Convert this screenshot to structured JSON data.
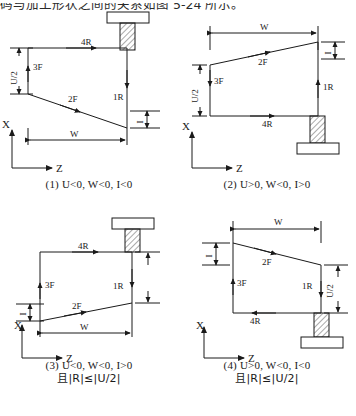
{
  "header": {
    "cropped_line": "码与加工形状之间的关系如图 5-24 所示。"
  },
  "figure": {
    "labels": {
      "axis_x": "X",
      "axis_z": "Z",
      "dim_w": "W",
      "dim_u_half": "U/2",
      "dim_i": "I",
      "seg_1r": "1R",
      "seg_2f": "2F",
      "seg_3f": "3F",
      "seg_4r": "4R"
    },
    "quadrants": [
      {
        "id": "1",
        "caption_line1": "(1) U<0,  W<0,  I<0",
        "caption_line2": "",
        "tool_position": "top-right",
        "tool_orientation": "down",
        "taper_direction": "down-right",
        "dim_left": "U/2",
        "dim_right": "I",
        "dim_bottom": "W",
        "dim_right_unlabeled": false
      },
      {
        "id": "2",
        "caption_line1": "(2) U>0,  W<0,  I>0",
        "caption_line2": "",
        "tool_position": "bottom-right",
        "tool_orientation": "up",
        "taper_direction": "up-right",
        "dim_left": "U/2",
        "dim_right": "I",
        "dim_top": "W",
        "dim_right_unlabeled": false
      },
      {
        "id": "3",
        "caption_line1": "(3) U<0,  W<0,  I>0",
        "caption_line2": "且|R|≤|U/2|",
        "tool_position": "top-right",
        "tool_orientation": "down",
        "taper_direction": "up-right",
        "dim_left": "I",
        "dim_right": "",
        "dim_bottom": "W",
        "dim_right_unlabeled": true
      },
      {
        "id": "4",
        "caption_line1": "(4) U>0,  W<0,  I<0",
        "caption_line2": "且|R|≤|U/2|",
        "tool_position": "bottom-right",
        "tool_orientation": "up",
        "taper_direction": "down-right",
        "dim_left": "I",
        "dim_right": "U/2",
        "dim_top": "W",
        "dim_right_unlabeled": false
      }
    ]
  },
  "colors": {
    "ink": "#1a1a1a",
    "paper": "#ffffff",
    "hatch": "#555555"
  }
}
